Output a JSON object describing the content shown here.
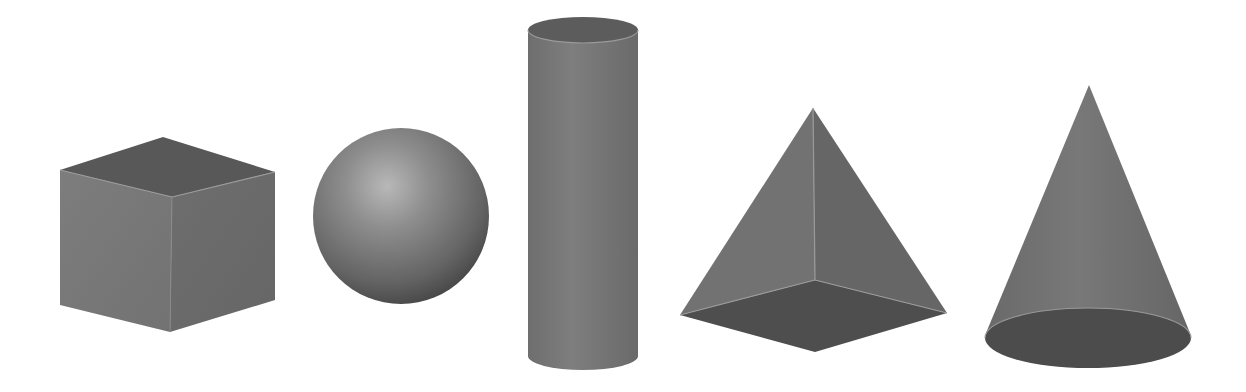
{
  "figure": {
    "title": "",
    "shapes": [
      {
        "id": "cube",
        "label": "Cube"
      },
      {
        "id": "sphere",
        "label": "Sphere"
      },
      {
        "id": "cylinder",
        "label": "Cylinder"
      },
      {
        "id": "pyramid",
        "label": "Square Pyramid"
      },
      {
        "id": "cone",
        "label": "Cone"
      }
    ],
    "colors": {
      "background": "#ffffff",
      "face_light": "#7a7a7a",
      "face_mid": "#6c6c6c",
      "face_dark": "#555555",
      "edge_highlight": "#9a9a9a",
      "sphere_highlight": "#b8b8b8",
      "sphere_edge": "#4a4a4a"
    }
  }
}
